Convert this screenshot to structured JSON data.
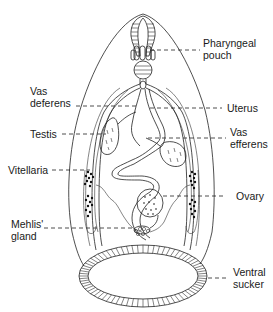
{
  "diagram": {
    "labels": [
      {
        "id": "pharyngeal-pouch",
        "lines": [
          "Pharyngeal",
          "pouch"
        ],
        "side": "right"
      },
      {
        "id": "vas-deferens",
        "lines": [
          "Vas",
          "deferens"
        ],
        "side": "left"
      },
      {
        "id": "uterus",
        "lines": [
          "Uterus"
        ],
        "side": "right"
      },
      {
        "id": "testis",
        "lines": [
          "Testis"
        ],
        "side": "left"
      },
      {
        "id": "vas-efferens",
        "lines": [
          "Vas",
          "efferens"
        ],
        "side": "right"
      },
      {
        "id": "vitellaria",
        "lines": [
          "Vitellaria"
        ],
        "side": "left"
      },
      {
        "id": "ovary",
        "lines": [
          "Ovary"
        ],
        "side": "right"
      },
      {
        "id": "mehlis-gland",
        "lines": [
          "Mehlis'",
          "gland"
        ],
        "side": "left"
      },
      {
        "id": "ventral-sucker",
        "lines": [
          "Ventral",
          "sucker"
        ],
        "side": "right"
      }
    ]
  }
}
